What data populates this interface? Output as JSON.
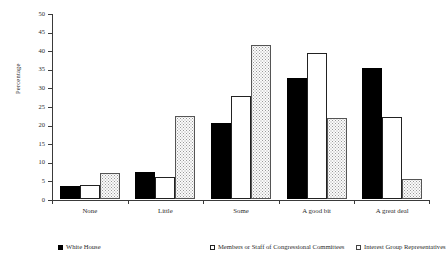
{
  "chart_data": {
    "type": "bar",
    "title": "",
    "xlabel": "",
    "ylabel": "Percentage",
    "ylim": [
      0,
      50
    ],
    "yticks": [
      0,
      5,
      10,
      15,
      20,
      25,
      30,
      35,
      40,
      45,
      50
    ],
    "grid": false,
    "legend_position": "bottom",
    "categories": [
      "None",
      "Little",
      "Some",
      "A good bit",
      "A great deal"
    ],
    "series": [
      {
        "name": "White House",
        "marker": "solid-black",
        "values": [
          3.5,
          7.2,
          20.3,
          32.6,
          35.1
        ]
      },
      {
        "name": "Members or Staff of Congressional Committees",
        "marker": "open-white",
        "values": [
          3.7,
          6.0,
          27.8,
          39.3,
          22.0
        ]
      },
      {
        "name": "Interest Group Representatives",
        "marker": "dotted-stipple",
        "values": [
          7.0,
          22.3,
          41.5,
          21.7,
          5.5
        ]
      }
    ]
  },
  "colors": {
    "axis": "#3a3a3a",
    "text": "#2b2b2b",
    "series_solid": "#000000",
    "series_open": "#ffffff",
    "series_dotted": "#fbfbfb"
  }
}
